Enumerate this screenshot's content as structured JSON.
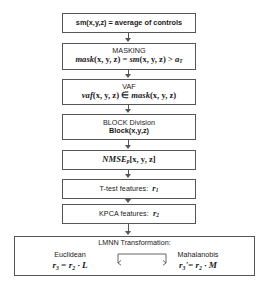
{
  "diagram": {
    "stroke_color": "#555555",
    "background": "#ffffff",
    "nodes": [
      {
        "id": "sm",
        "label": "sm(x,y,z) = average of controls",
        "caption": "",
        "formula": ""
      },
      {
        "id": "masking",
        "caption": "MASKING",
        "formula": "mask(x, y, z) = sm(x, y, z) > a_T"
      },
      {
        "id": "vaf",
        "caption": "VAF",
        "formula": "vaf(x, y, z) ∈ mask(x, y, z)"
      },
      {
        "id": "block",
        "caption": "BLOCK Division",
        "formula": "Block(x,y,z)"
      },
      {
        "id": "nmse",
        "caption": "",
        "formula": "NMSE_p[x, y, z]"
      },
      {
        "id": "ttest",
        "caption": "T-test features:",
        "formula": "r_1"
      },
      {
        "id": "kpca",
        "caption": "KPCA features:",
        "formula": "r_2"
      }
    ],
    "lmnn": {
      "title": "LMNN Transformation:",
      "left_label": "Euclidean",
      "left_formula": "r_3 = r_2 · L",
      "right_label": "Mahalanobis",
      "right_formula": "r_3' = r_2 · M"
    }
  },
  "boxes": {
    "sm": {
      "text": "sm(x,y,z) = average of controls"
    },
    "masking": {
      "caption": "MASKING",
      "f_mask": "mask",
      "f_args1": "(x, y, z)",
      "f_eq": " = ",
      "f_sm": "sm",
      "f_args2": "(x, y, z)",
      "f_gt": " > ",
      "f_a": "a",
      "f_sub": "T"
    },
    "vaf": {
      "caption": "VAF",
      "f_vaf": "vaf",
      "f_args1": "(x, y, z)",
      "f_in": " ∈ ",
      "f_mask": "mask",
      "f_args2": "(x, y, z)"
    },
    "block": {
      "caption": "BLOCK Division",
      "formula": "Block(x,y,z)"
    },
    "nmse": {
      "name": "NMSE",
      "sub": "p",
      "args": "[x, y, z]"
    },
    "ttest": {
      "caption": "T-test features:",
      "symbol": "r",
      "sub": "1"
    },
    "kpca": {
      "caption": "KPCA features:",
      "symbol": "r",
      "sub": "2"
    },
    "lmnn": {
      "title": "LMNN Transformation:",
      "left_label": "Euclidean",
      "left_r": "r",
      "left_sub": "3",
      "left_eq": " = ",
      "left_r2": "r",
      "left_sub2": "2",
      "left_dot": " · ",
      "left_mat": "L",
      "right_label": "Mahalanobis",
      "right_r": "r",
      "right_sub": "3",
      "right_prime": "'",
      "right_eq": "= ",
      "right_r2": "r",
      "right_sub2": "2",
      "right_dot": " · ",
      "right_mat": "M"
    }
  }
}
